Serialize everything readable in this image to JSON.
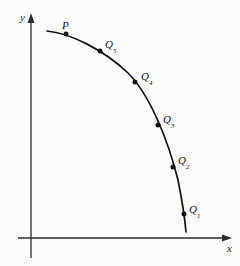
{
  "figure": {
    "kind": "secant-lines-to-tangent-diagram",
    "background_color": "#fbfbfa",
    "ink_color": "#121212",
    "axes": {
      "x_label": "x",
      "y_label": "y",
      "origin": [
        31,
        238
      ],
      "x_axis_from": [
        18,
        238
      ],
      "x_axis_to": [
        228,
        238
      ],
      "y_axis_from": [
        31,
        258
      ],
      "y_axis_to": [
        31,
        14
      ],
      "arrowheads": [
        "x-positive",
        "y-positive"
      ],
      "grid": false,
      "ticks": []
    },
    "curve": {
      "description": "concave-decreasing-arc",
      "start": [
        47,
        31
      ],
      "end": [
        186,
        232
      ],
      "stroke_width": 1.6
    },
    "points": [
      {
        "name": "P",
        "label": "P",
        "sub": "",
        "x": 66,
        "y": 34
      },
      {
        "name": "Q5",
        "label": "Q",
        "sub": "5",
        "x": 100,
        "y": 51
      },
      {
        "name": "Q4",
        "label": "Q",
        "sub": "4",
        "x": 135,
        "y": 82
      },
      {
        "name": "Q3",
        "label": "Q",
        "sub": "3",
        "x": 158,
        "y": 125
      },
      {
        "name": "Q2",
        "label": "Q",
        "sub": "2",
        "x": 173,
        "y": 167
      },
      {
        "name": "Q1",
        "label": "Q",
        "sub": "1",
        "x": 184,
        "y": 214
      }
    ]
  }
}
